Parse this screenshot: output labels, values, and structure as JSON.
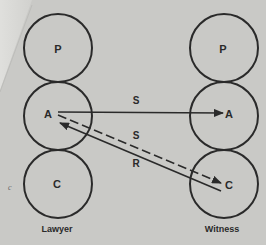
{
  "diagram": {
    "type": "transactional-analysis",
    "columns": [
      {
        "id": "lawyer",
        "label": "Lawyer",
        "states": [
          {
            "id": "P",
            "label": "P"
          },
          {
            "id": "A",
            "label": "A"
          },
          {
            "id": "C",
            "label": "C"
          }
        ]
      },
      {
        "id": "witness",
        "label": "Witness",
        "states": [
          {
            "id": "P",
            "label": "P"
          },
          {
            "id": "A",
            "label": "A"
          },
          {
            "id": "C",
            "label": "C"
          }
        ]
      }
    ],
    "transactions": [
      {
        "from": "lawyer.A",
        "to": "witness.A",
        "label": "S",
        "style": "solid"
      },
      {
        "from": "lawyer.A",
        "to": "witness.C",
        "label": "S",
        "style": "dashed"
      },
      {
        "from": "witness.C",
        "to": "lawyer.A",
        "label": "R",
        "style": "solid"
      }
    ],
    "stray_mark": "c",
    "colors": {
      "paper": "#c9c9c6",
      "ink": "#2a2a2a"
    }
  }
}
